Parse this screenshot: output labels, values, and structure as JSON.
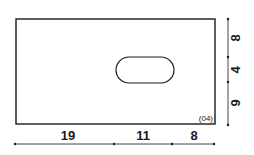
{
  "drawing": {
    "part_id": "(04)",
    "horizontal_dimensions": [
      "19",
      "11",
      "8"
    ],
    "vertical_dimensions": [
      "8",
      "4",
      "9"
    ],
    "colors": {
      "line": "#1a1a1a",
      "background": "#ffffff"
    }
  }
}
